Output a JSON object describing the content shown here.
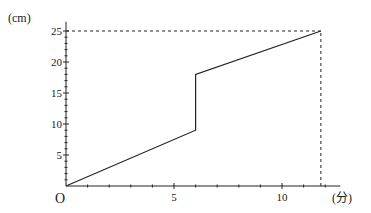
{
  "chart_data": {
    "type": "line",
    "title": "",
    "xlabel": "(分)",
    "ylabel": "(cm)",
    "origin_label": "O",
    "x_ticks": [
      5,
      10
    ],
    "x_tick_labels": [
      "5",
      "10"
    ],
    "y_ticks": [
      5,
      10,
      15,
      20,
      25
    ],
    "y_tick_labels": [
      "5",
      "10",
      "15",
      "20",
      "25"
    ],
    "xlim": [
      0,
      12.7
    ],
    "ylim": [
      0,
      26.5
    ],
    "minor_tick_step_x": 1,
    "minor_tick_step_y": 1,
    "grid": false,
    "legend": null,
    "series": [
      {
        "name": "height",
        "points": [
          [
            0,
            0
          ],
          [
            6,
            9
          ],
          [
            6,
            18
          ],
          [
            11.8,
            25
          ]
        ]
      }
    ],
    "reference_lines": [
      {
        "type": "dashed-horizontal",
        "from": [
          0,
          25
        ],
        "to": [
          11.8,
          25
        ]
      },
      {
        "type": "dashed-vertical",
        "from": [
          11.8,
          0
        ],
        "to": [
          11.8,
          25
        ]
      }
    ]
  }
}
